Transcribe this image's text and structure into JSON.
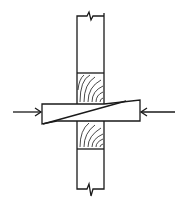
{
  "diagram": {
    "title": "",
    "elements": [
      {
        "name": "post-upper",
        "type": "timber-post",
        "break": "top"
      },
      {
        "name": "end-grain-block-upper",
        "type": "wood-grain"
      },
      {
        "name": "folding-wedges",
        "type": "wedge-pair"
      },
      {
        "name": "end-grain-block-lower",
        "type": "wood-grain"
      },
      {
        "name": "post-lower",
        "type": "timber-post",
        "break": "bottom"
      },
      {
        "name": "force-arrow-left",
        "type": "arrow",
        "direction": "right"
      },
      {
        "name": "force-arrow-right",
        "type": "arrow",
        "direction": "left"
      }
    ],
    "colors": {
      "stroke": "#1a1a1a",
      "background": "#ffffff"
    }
  }
}
